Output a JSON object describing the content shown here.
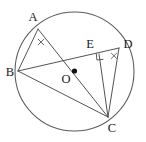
{
  "figure": {
    "type": "circle-geometry-diagram",
    "background_color": "#ffffff",
    "stroke_color": "#4a4a4a",
    "label_color": "#1a1a1a",
    "circle": {
      "cx": 74.5,
      "cy": 71.5,
      "r": 59.5
    },
    "center_marker": {
      "label": "O",
      "label_x": 66,
      "label_y": 82,
      "dot_x": 74.5,
      "dot_y": 71,
      "dot_r": 2.6
    },
    "points": [
      {
        "name": "A",
        "x": 38.0,
        "y": 29.0,
        "label": "A",
        "label_x": 33,
        "label_y": 21
      },
      {
        "name": "B",
        "x": 18.0,
        "y": 71.0,
        "label": "B",
        "label_x": 10,
        "label_y": 76
      },
      {
        "name": "C",
        "x": 108.0,
        "y": 117.0,
        "label": "C",
        "label_x": 110,
        "label_y": 130
      },
      {
        "name": "D",
        "x": 119.0,
        "y": 48.0,
        "label": "D",
        "label_x": 124,
        "label_y": 47
      },
      {
        "name": "E",
        "x": 99.0,
        "y": 54.0,
        "label": "E",
        "label_x": 85,
        "label_y": 48
      }
    ],
    "segments": [
      {
        "name": "AB",
        "from": "A",
        "to": "B"
      },
      {
        "name": "AC",
        "from": "A",
        "to": "C"
      },
      {
        "name": "BD",
        "from": "B",
        "to": "D"
      },
      {
        "name": "BC",
        "from": "B",
        "to": "C"
      },
      {
        "name": "DC",
        "from": "D",
        "to": "C"
      },
      {
        "name": "EC",
        "from": "E",
        "to": "C"
      }
    ],
    "angle_marks": [
      {
        "name": "angle-BAC",
        "symbol": "x",
        "at_point": "A",
        "x": 41,
        "y": 42
      },
      {
        "name": "angle-BDC",
        "symbol": "x",
        "at_point": "D",
        "x": 114,
        "y": 56
      }
    ],
    "right_angle": {
      "name": "angle-BEC",
      "at_point": "E",
      "x": 96.5,
      "y": 54.0,
      "size": 6.5
    }
  }
}
